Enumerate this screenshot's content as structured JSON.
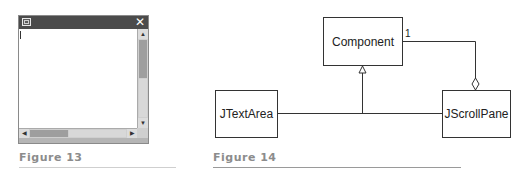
{
  "figure13": {
    "caption": "Figure 13",
    "window": {
      "menu_icon": "window-menu-icon",
      "close_glyph": "✕",
      "scroll_up_glyph": "▲",
      "scroll_down_glyph": "▼",
      "scroll_left_glyph": "◀",
      "scroll_right_glyph": "▶"
    }
  },
  "figure14": {
    "caption": "Figure 14",
    "classes": {
      "component": "Component",
      "jtextarea": "JTextArea",
      "jscrollpane": "JScrollPane"
    },
    "relations": [
      {
        "from": "JTextArea",
        "to": "Component",
        "type": "generalization"
      },
      {
        "from": "JScrollPane",
        "to": "Component",
        "type": "generalization"
      },
      {
        "from": "JScrollPane",
        "to": "Component",
        "type": "aggregation",
        "multiplicity": "1"
      }
    ],
    "multiplicity_label": "1"
  }
}
